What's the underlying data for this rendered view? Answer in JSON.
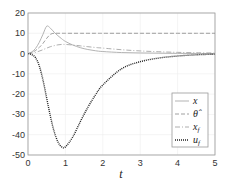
{
  "chart_data": {
    "type": "line",
    "title": "",
    "xlabel": "t",
    "ylabel": "",
    "xlim": [
      0,
      5
    ],
    "ylim": [
      -50,
      20
    ],
    "xticks": [
      "0",
      "1",
      "2",
      "3",
      "4",
      "5"
    ],
    "yticks": [
      "20",
      "10",
      "0",
      "-10",
      "-20",
      "-30",
      "-40",
      "-50"
    ],
    "grid": true,
    "legend_position": "lower right",
    "x": [
      0,
      0.1,
      0.2,
      0.3,
      0.4,
      0.5,
      0.6,
      0.7,
      0.8,
      0.9,
      1.0,
      1.2,
      1.4,
      1.6,
      1.8,
      2.0,
      2.5,
      3.0,
      3.5,
      4.0,
      4.5,
      5.0
    ],
    "series": [
      {
        "name": "x",
        "style": "solid",
        "color": "#aaaaaa",
        "values": [
          0,
          0.8,
          2.5,
          5.5,
          9.5,
          13.5,
          12.5,
          10.5,
          8.8,
          7.3,
          6.0,
          4.2,
          2.9,
          2.0,
          1.4,
          1.0,
          0.5,
          0.3,
          0.2,
          0.1,
          0.05,
          0.0
        ]
      },
      {
        "name": "θ̂",
        "style": "dashed",
        "color": "#888888",
        "values": [
          0,
          0.5,
          1.5,
          3.0,
          5.0,
          7.5,
          9.5,
          10.0,
          10.0,
          10.0,
          10.0,
          10.0,
          10.0,
          10.0,
          10.0,
          10.0,
          10.0,
          10.0,
          10.0,
          10.0,
          10.0,
          10.0
        ]
      },
      {
        "name": "x_f",
        "style": "dashdot",
        "color": "#999999",
        "values": [
          0,
          0.2,
          0.6,
          1.2,
          1.9,
          2.7,
          3.4,
          3.9,
          4.3,
          4.5,
          4.5,
          4.2,
          3.8,
          3.4,
          3.0,
          2.7,
          1.9,
          1.3,
          0.9,
          0.6,
          0.4,
          0.3
        ]
      },
      {
        "name": "u_f",
        "style": "dotted",
        "color": "#222222",
        "values": [
          0,
          -0.5,
          -2.0,
          -6.0,
          -13.0,
          -22.0,
          -31.0,
          -38.5,
          -43.5,
          -46.0,
          -46.0,
          -41.0,
          -33.5,
          -26.5,
          -20.5,
          -15.5,
          -7.5,
          -4.0,
          -2.2,
          -1.2,
          -0.6,
          -0.3
        ]
      }
    ]
  },
  "legend": {
    "items": [
      {
        "label": "x"
      },
      {
        "label": "θ̂"
      },
      {
        "label": "x_f"
      },
      {
        "label": "u_f"
      }
    ]
  },
  "axes": {
    "xlabel": "t"
  }
}
